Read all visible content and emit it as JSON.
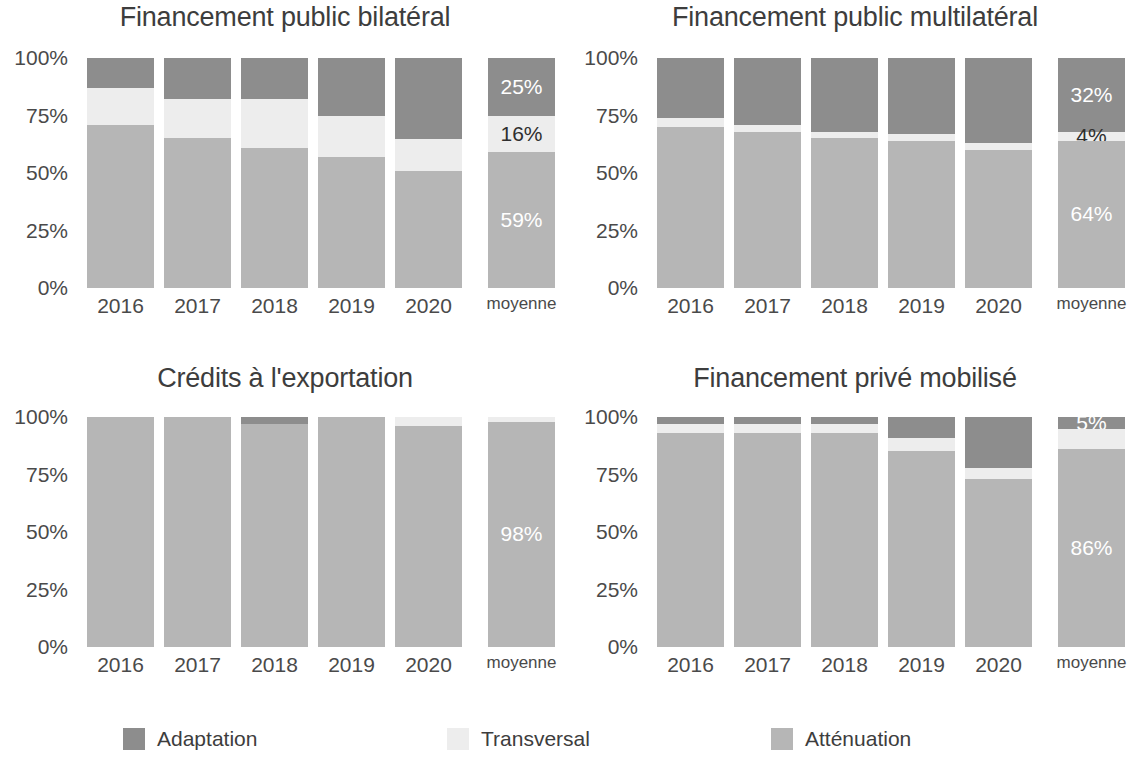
{
  "legend": {
    "items": [
      {
        "label": "Adaptation",
        "key": "adaptation",
        "color": "#8d8d8d"
      },
      {
        "label": "Transversal",
        "key": "transversal",
        "color": "#ededed"
      },
      {
        "label": "Atténuation",
        "key": "attenuation",
        "color": "#b6b6b6"
      }
    ]
  },
  "axis": {
    "y_ticks": [
      "0%",
      "25%",
      "50%",
      "75%",
      "100%"
    ],
    "x_categories": [
      "2016",
      "2017",
      "2018",
      "2019",
      "2020",
      "moyenne"
    ]
  },
  "panels": [
    {
      "title": "Financement public bilatéral"
    },
    {
      "title": "Financement public multilatéral"
    },
    {
      "title": "Crédits à l'exportation"
    },
    {
      "title": "Financement privé mobilisé"
    }
  ],
  "chart_data": [
    {
      "type": "bar",
      "stacked": true,
      "normalized": true,
      "title": "Financement public bilatéral",
      "xlabel": "",
      "ylabel": "",
      "ylim": [
        0,
        100
      ],
      "ytick_labels": [
        "0%",
        "25%",
        "50%",
        "75%",
        "100%"
      ],
      "grid": false,
      "legend_position": "bottom",
      "categories": [
        "2016",
        "2017",
        "2018",
        "2019",
        "2020",
        "moyenne"
      ],
      "series": [
        {
          "name": "Adaptation",
          "values": [
            13,
            18,
            18,
            25,
            35
          ]
        },
        {
          "name": "Transversal",
          "values": [
            16,
            17,
            21,
            18,
            14
          ]
        },
        {
          "name": "Atténuation",
          "values": [
            71,
            65,
            61,
            57,
            51
          ]
        }
      ],
      "average_bar": {
        "category": "moyenne",
        "segments": [
          {
            "name": "Adaptation",
            "value": 25,
            "label": "25%"
          },
          {
            "name": "Transversal",
            "value": 16,
            "label": "16%"
          },
          {
            "name": "Atténuation",
            "value": 59,
            "label": "59%"
          }
        ]
      }
    },
    {
      "type": "bar",
      "stacked": true,
      "normalized": true,
      "title": "Financement public multilatéral",
      "xlabel": "",
      "ylabel": "",
      "ylim": [
        0,
        100
      ],
      "ytick_labels": [
        "0%",
        "25%",
        "50%",
        "75%",
        "100%"
      ],
      "grid": false,
      "legend_position": "bottom",
      "categories": [
        "2016",
        "2017",
        "2018",
        "2019",
        "2020",
        "moyenne"
      ],
      "series": [
        {
          "name": "Adaptation",
          "values": [
            26,
            29,
            32,
            33,
            37
          ]
        },
        {
          "name": "Transversal",
          "values": [
            4,
            3,
            3,
            3,
            3
          ]
        },
        {
          "name": "Atténuation",
          "values": [
            70,
            68,
            65,
            64,
            60
          ]
        }
      ],
      "average_bar": {
        "category": "moyenne",
        "segments": [
          {
            "name": "Adaptation",
            "value": 32,
            "label": "32%"
          },
          {
            "name": "Transversal",
            "value": 4,
            "label": "4%"
          },
          {
            "name": "Atténuation",
            "value": 64,
            "label": "64%"
          }
        ]
      }
    },
    {
      "type": "bar",
      "stacked": true,
      "normalized": true,
      "title": "Crédits à l'exportation",
      "xlabel": "",
      "ylabel": "",
      "ylim": [
        0,
        100
      ],
      "ytick_labels": [
        "0%",
        "25%",
        "50%",
        "75%",
        "100%"
      ],
      "grid": false,
      "legend_position": "bottom",
      "categories": [
        "2016",
        "2017",
        "2018",
        "2019",
        "2020",
        "moyenne"
      ],
      "series": [
        {
          "name": "Adaptation",
          "values": [
            0,
            0,
            3,
            0,
            0
          ]
        },
        {
          "name": "Transversal",
          "values": [
            0,
            0,
            0,
            0,
            4
          ]
        },
        {
          "name": "Atténuation",
          "values": [
            100,
            100,
            97,
            100,
            96
          ]
        }
      ],
      "average_bar": {
        "category": "moyenne",
        "segments": [
          {
            "name": "Adaptation",
            "value": 0,
            "label": ""
          },
          {
            "name": "Transversal",
            "value": 2,
            "label": ""
          },
          {
            "name": "Atténuation",
            "value": 98,
            "label": "98%"
          }
        ]
      }
    },
    {
      "type": "bar",
      "stacked": true,
      "normalized": true,
      "title": "Financement privé mobilisé",
      "xlabel": "",
      "ylabel": "",
      "ylim": [
        0,
        100
      ],
      "ytick_labels": [
        "0%",
        "25%",
        "50%",
        "75%",
        "100%"
      ],
      "grid": false,
      "legend_position": "bottom",
      "categories": [
        "2016",
        "2017",
        "2018",
        "2019",
        "2020",
        "moyenne"
      ],
      "series": [
        {
          "name": "Adaptation",
          "values": [
            3,
            3,
            3,
            9,
            22
          ]
        },
        {
          "name": "Transversal",
          "values": [
            4,
            4,
            4,
            6,
            5
          ]
        },
        {
          "name": "Atténuation",
          "values": [
            93,
            93,
            93,
            85,
            73
          ]
        }
      ],
      "average_bar": {
        "category": "moyenne",
        "segments": [
          {
            "name": "Adaptation",
            "value": 5,
            "label": "5%"
          },
          {
            "name": "Transversal",
            "value": 9,
            "label": ""
          },
          {
            "name": "Atténuation",
            "value": 86,
            "label": "86%"
          }
        ]
      }
    }
  ]
}
